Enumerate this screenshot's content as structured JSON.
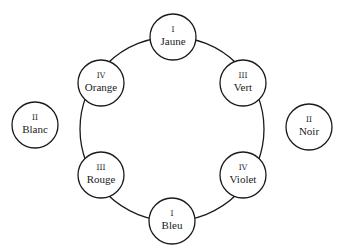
{
  "diagram": {
    "ring": {
      "cx": 172,
      "cy": 129,
      "r": 92
    },
    "node_radius": 23,
    "stroke_color": "#1a1a1a",
    "nodes": [
      {
        "id": "jaune",
        "numeral": "I",
        "label": "Jaune",
        "cx": 173,
        "cy": 37,
        "on_ring": true
      },
      {
        "id": "vert",
        "numeral": "III",
        "label": "Vert",
        "cx": 243,
        "cy": 83,
        "on_ring": true
      },
      {
        "id": "violet",
        "numeral": "IV",
        "label": "Violet",
        "cx": 243,
        "cy": 175,
        "on_ring": true
      },
      {
        "id": "bleu",
        "numeral": "I",
        "label": "Bleu",
        "cx": 172,
        "cy": 221,
        "on_ring": true
      },
      {
        "id": "rouge",
        "numeral": "III",
        "label": "Rouge",
        "cx": 101,
        "cy": 175,
        "on_ring": true
      },
      {
        "id": "orange",
        "numeral": "IV",
        "label": "Orange",
        "cx": 101,
        "cy": 83,
        "on_ring": true
      },
      {
        "id": "blanc",
        "numeral": "II",
        "label": "Blanc",
        "cx": 35,
        "cy": 125,
        "on_ring": false
      },
      {
        "id": "noir",
        "numeral": "II",
        "label": "Noir",
        "cx": 309,
        "cy": 127,
        "on_ring": false
      }
    ]
  }
}
